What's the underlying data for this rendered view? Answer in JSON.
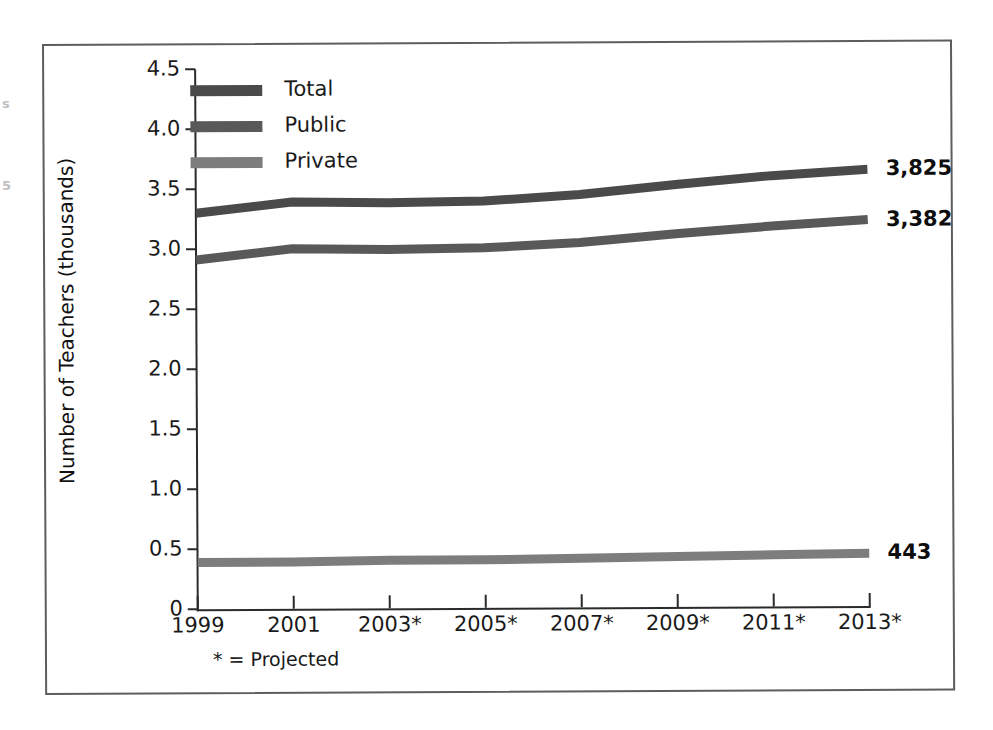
{
  "figure": {
    "footnote": "* = Projected",
    "edge_artifacts": [
      "s",
      "5"
    ]
  },
  "legend": {
    "position": "top-left-inside",
    "items": [
      {
        "label": "Total",
        "color": "#4a4a4a",
        "icon": "line-swatch-icon"
      },
      {
        "label": "Public",
        "color": "#595959",
        "icon": "line-swatch-icon"
      },
      {
        "label": "Private",
        "color": "#7d7d7d",
        "icon": "line-swatch-icon"
      }
    ]
  },
  "end_labels": [
    {
      "series": "Total",
      "value": "3,825"
    },
    {
      "series": "Public",
      "value": "3,382"
    },
    {
      "series": "Private",
      "value": "443"
    }
  ],
  "chart_data": {
    "type": "line",
    "title": "",
    "subtitle": "",
    "xlabel": "",
    "ylabel": "Number of Teachers (thousands)",
    "grid": false,
    "legend_position": "top-left-inside",
    "categories": [
      "1999",
      "2001",
      "2003*",
      "2005*",
      "2007*",
      "2009*",
      "2011*",
      "2013*"
    ],
    "x": [
      1999,
      2001,
      2003,
      2005,
      2007,
      2009,
      2011,
      2013
    ],
    "xlim": [
      1999,
      2013
    ],
    "ylim": [
      0,
      4.5
    ],
    "yticks": [
      "0",
      "0.5",
      "1.0",
      "1.5",
      "2.0",
      "2.5",
      "3.0",
      "3.5",
      "4.0",
      "4.5"
    ],
    "ytick_values": [
      0,
      0.5,
      1.0,
      1.5,
      2.0,
      2.5,
      3.0,
      3.5,
      4.0,
      4.5
    ],
    "annotations": [
      "* = Projected"
    ],
    "series": [
      {
        "name": "Total",
        "color": "#4a4a4a",
        "end_label": "3,825",
        "values": [
          3.3,
          3.39,
          3.38,
          3.39,
          3.44,
          3.52,
          3.59,
          3.64
        ]
      },
      {
        "name": "Public",
        "color": "#595959",
        "end_label": "3,382",
        "values": [
          2.91,
          3.0,
          2.99,
          3.0,
          3.04,
          3.11,
          3.17,
          3.22
        ]
      },
      {
        "name": "Private",
        "color": "#7d7d7d",
        "end_label": "443",
        "values": [
          0.39,
          0.39,
          0.4,
          0.4,
          0.41,
          0.42,
          0.43,
          0.44
        ]
      }
    ]
  }
}
